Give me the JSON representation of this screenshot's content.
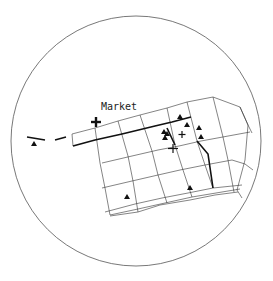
{
  "map": {
    "label": "Market",
    "colors": {
      "line": "#333333",
      "thick": "#111111",
      "bg": "#ffffff"
    },
    "legend_markers": {
      "triangle": "triangle-icon",
      "cross": "cross-icon"
    }
  }
}
